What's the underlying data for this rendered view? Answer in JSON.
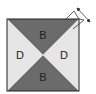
{
  "diagram": {
    "square": {
      "x": 7,
      "y": 19,
      "size": 72,
      "border": "#222222"
    },
    "colors": {
      "dark": "#6b6b6b",
      "light": "#e6e6e6"
    },
    "regions": [
      {
        "id": "top",
        "label": "B",
        "shade": "dark"
      },
      {
        "id": "left",
        "label": "D",
        "shade": "light"
      },
      {
        "id": "right",
        "label": "D",
        "shade": "light"
      },
      {
        "id": "bottom",
        "label": "B",
        "shade": "dark"
      }
    ],
    "rotation_indicator": "double-arrow-icon"
  }
}
